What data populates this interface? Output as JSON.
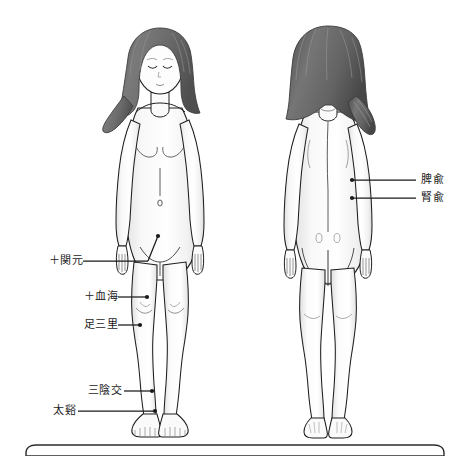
{
  "figure": {
    "title_alt": "",
    "views": [
      {
        "name": "front-view",
        "position": "left"
      },
      {
        "name": "back-view",
        "position": "right"
      }
    ],
    "skin_color": "#fdfdfd",
    "shade_color": "#e9e9e9",
    "outline_color": "#1e1e1e",
    "hair_color": "#6e6e6e",
    "hair_dark_color": "#4a4a4a",
    "leader_color": "#1a1a1a",
    "background_color": "#ffffff"
  },
  "labels": {
    "front": [
      {
        "name": "kangen",
        "text": "＋関元",
        "x": 28,
        "y": 255,
        "leader_x1": 83,
        "leader_y1": 261,
        "leader_x2": 155,
        "leader_y2": 237
      },
      {
        "name": "kekkai",
        "text": "＋血海",
        "x": 62,
        "y": 290,
        "leader_x1": 118,
        "leader_y1": 297,
        "leader_x2": 149,
        "leader_y2": 297
      },
      {
        "name": "ashisanri",
        "text": "足三里",
        "x": 62,
        "y": 318,
        "leader_x1": 118,
        "leader_y1": 325,
        "leader_x2": 139,
        "leader_y2": 325
      },
      {
        "name": "saninko",
        "text": "三陰交",
        "x": 68,
        "y": 384,
        "leader_x1": 124,
        "leader_y1": 391,
        "leader_x2": 152,
        "leader_y2": 391
      },
      {
        "name": "taikei",
        "text": "太谿",
        "x": 38,
        "y": 404,
        "leader_x1": 80,
        "leader_y1": 411,
        "leader_x2": 155,
        "leader_y2": 411
      }
    ],
    "back": [
      {
        "name": "hiyu",
        "text": "脾兪",
        "x": 422,
        "y": 174,
        "leader_x1": 352,
        "leader_y1": 180,
        "leader_x2": 417,
        "leader_y2": 180
      },
      {
        "name": "jinyu",
        "text": "腎兪",
        "x": 422,
        "y": 192,
        "leader_x1": 352,
        "leader_y1": 198,
        "leader_x2": 417,
        "leader_y2": 198
      }
    ]
  },
  "bottom_panel": {
    "name": "bottom-panel",
    "top": 445,
    "border_color": "#2b2b2b",
    "text": ""
  }
}
